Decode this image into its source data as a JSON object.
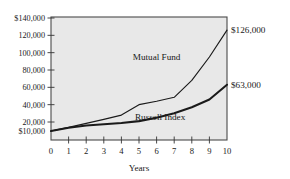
{
  "chart_data": {
    "type": "line",
    "title": "",
    "xlabel": "Years",
    "ylabel": "",
    "grid": false,
    "legend_position": "inline-annotation",
    "x": [
      0,
      1,
      2,
      3,
      4,
      5,
      6,
      7,
      8,
      9,
      10
    ],
    "xlim": [
      0,
      10
    ],
    "ylim": [
      10000,
      140000
    ],
    "x_tick_labels": [
      "0",
      "1",
      "2",
      "3",
      "4",
      "5",
      "6",
      "7",
      "8",
      "9",
      "10"
    ],
    "y_tick_labels": [
      "$140,000",
      "120,000",
      "100,000",
      "80,000",
      "60,000",
      "40,000",
      "20,000",
      "$10,000"
    ],
    "y_tick_values": [
      140000,
      120000,
      100000,
      80000,
      60000,
      40000,
      20000,
      10000
    ],
    "series": [
      {
        "name": "Mutual Fund",
        "values": [
          10000,
          14000,
          18500,
          23000,
          28000,
          40000,
          44000,
          48500,
          68000,
          95000,
          126000
        ],
        "end_label": "$126,000",
        "label_x": 6.0,
        "label_y": 92000
      },
      {
        "name": "Russell Index",
        "values": [
          10000,
          13500,
          16000,
          17500,
          19000,
          21000,
          25000,
          30000,
          37000,
          46000,
          63000
        ],
        "end_label": "$63,000",
        "label_x": 6.2,
        "label_y": 22000
      }
    ]
  },
  "colors": {
    "plot_background": "#e8e8e8",
    "page_background": "#ffffff",
    "axis": "#4a4a4a",
    "text": "#1a1a1a",
    "series_line": "#1a1a1a"
  }
}
